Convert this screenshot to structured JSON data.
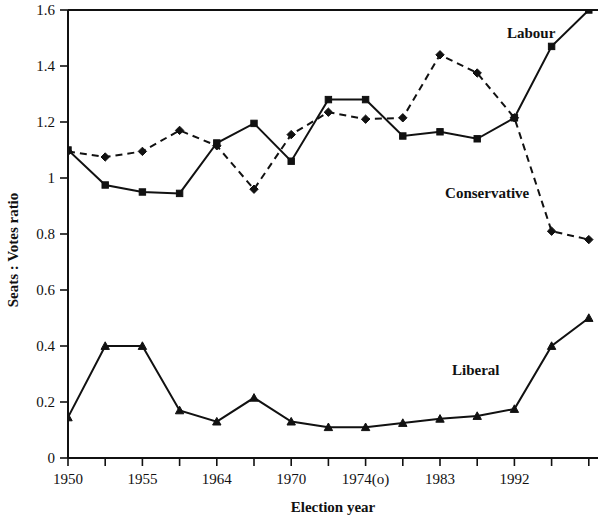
{
  "chart_data": {
    "type": "line",
    "title": "",
    "xlabel": "Election year",
    "ylabel": "Seats : Votes ratio",
    "ylim": [
      0,
      1.6
    ],
    "ytick_labels": [
      "0",
      "0.2",
      "0.4",
      "0.6",
      "0.8",
      "1",
      "1.2",
      "1.4",
      "1.6"
    ],
    "ytick_values": [
      0,
      0.2,
      0.4,
      0.6,
      0.8,
      1.0,
      1.2,
      1.4,
      1.6
    ],
    "grid": false,
    "legend_position": "inline-right",
    "x_index": [
      0,
      1,
      2,
      3,
      4,
      5,
      6,
      7,
      8,
      9,
      10,
      11,
      12,
      13,
      14
    ],
    "categories": [
      "1950",
      "1951",
      "1955",
      "1959",
      "1964",
      "1966",
      "1970",
      "1974(f)",
      "1974(o)",
      "1979",
      "1983",
      "1987",
      "1992",
      "1997",
      ""
    ],
    "xtick_labels_shown": [
      "1950",
      "",
      "1955",
      "",
      "1964",
      "",
      "1970",
      "",
      "1974(o)",
      "",
      "1983",
      "",
      "1992",
      "",
      ""
    ],
    "series": [
      {
        "name": "Labour",
        "style": "solid",
        "marker": "square",
        "label_x_index": 13.1,
        "label_y": 1.5,
        "values": [
          1.1,
          0.975,
          0.95,
          0.945,
          1.125,
          1.195,
          1.06,
          1.28,
          1.28,
          1.15,
          1.165,
          1.14,
          1.215,
          1.47,
          1.6
        ]
      },
      {
        "name": "Conservative",
        "style": "dashed",
        "marker": "diamond",
        "label_x_index": 12.4,
        "label_y": 0.93,
        "values": [
          1.095,
          1.075,
          1.095,
          1.17,
          1.115,
          0.96,
          1.155,
          1.235,
          1.21,
          1.215,
          1.44,
          1.375,
          1.215,
          0.81,
          0.78
        ]
      },
      {
        "name": "Liberal",
        "style": "solid",
        "marker": "triangle",
        "label_x_index": 11.6,
        "label_y": 0.295,
        "values": [
          0.145,
          0.4,
          0.4,
          0.17,
          0.13,
          0.215,
          0.13,
          0.11,
          0.11,
          0.125,
          0.14,
          0.15,
          0.175,
          0.4,
          0.5
        ]
      }
    ]
  },
  "axis": {
    "x_axis_title": "Election year",
    "y_axis_title": "Seats : Votes ratio"
  }
}
